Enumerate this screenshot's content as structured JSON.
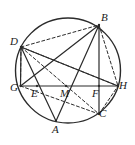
{
  "figure": {
    "type": "geometry-diagram",
    "canvas": {
      "width": 135,
      "height": 145,
      "background": "#ffffff"
    },
    "style": {
      "stroke": "#2b2b2b",
      "solid_width": 1.2,
      "dashed_width": 1.0,
      "dash_pattern": "3,2.4",
      "circle_width": 1.4,
      "label_color": "#1a1a1a",
      "label_size": 11
    },
    "circle": {
      "cx": 68,
      "cy": 70.5,
      "r": 52.5
    },
    "points": [
      {
        "id": "B",
        "label": "B",
        "x": 99,
        "y": 25,
        "lx": 101,
        "ly": 12,
        "on_circle": true
      },
      {
        "id": "D",
        "label": "D",
        "x": 21,
        "y": 47,
        "lx": 10,
        "ly": 36,
        "on_circle": true
      },
      {
        "id": "G",
        "label": "G",
        "x": 20.5,
        "y": 86,
        "lx": 10,
        "ly": 82,
        "on_circle": true
      },
      {
        "id": "H",
        "label": "H",
        "x": 118,
        "y": 86,
        "lx": 119,
        "ly": 80,
        "on_circle": true
      },
      {
        "id": "A",
        "label": "A",
        "x": 56,
        "y": 121,
        "lx": 52,
        "ly": 124,
        "on_circle": true
      },
      {
        "id": "C",
        "label": "C",
        "x": 99,
        "y": 114,
        "lx": 99,
        "ly": 108,
        "on_circle": true
      },
      {
        "id": "E",
        "label": "E",
        "x": 37,
        "y": 86,
        "lx": 31,
        "ly": 88,
        "on_circle": false
      },
      {
        "id": "M",
        "label": "M",
        "x": 66,
        "y": 86,
        "lx": 60,
        "ly": 88,
        "on_circle": false
      },
      {
        "id": "F",
        "label": "F",
        "x": 99,
        "y": 86,
        "lx": 92,
        "ly": 88,
        "on_circle": false
      }
    ],
    "segments_solid": [
      {
        "name": "chord-GH",
        "from": "G",
        "to": "H"
      },
      {
        "name": "chord-DA",
        "from": "D",
        "to": "A"
      },
      {
        "name": "chord-DH",
        "from": "D",
        "to": "H"
      },
      {
        "name": "chord-BA",
        "from": "B",
        "to": "A"
      },
      {
        "name": "chord-BC",
        "from": "B",
        "to": "C"
      },
      {
        "name": "chord-GB",
        "from": "G",
        "to": "B"
      },
      {
        "name": "chord-DG",
        "from": "D",
        "to": "G"
      }
    ],
    "segments_dashed": [
      {
        "name": "chord-DB",
        "from": "D",
        "to": "B"
      },
      {
        "name": "chord-DC",
        "from": "D",
        "to": "C"
      },
      {
        "name": "chord-DF-H",
        "from": "D",
        "to": "H"
      },
      {
        "name": "chord-BH",
        "from": "B",
        "to": "H"
      },
      {
        "name": "chord-GC",
        "from": "G",
        "to": "C"
      },
      {
        "name": "chord-CH",
        "from": "C",
        "to": "H"
      },
      {
        "name": "vertical-D-G",
        "from": "D",
        "to": "G"
      }
    ]
  }
}
